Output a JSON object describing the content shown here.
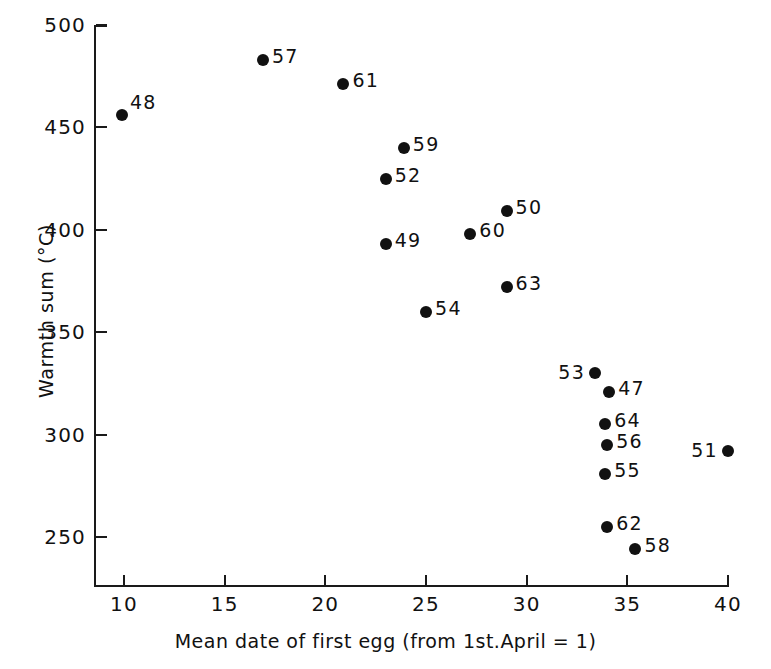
{
  "chart_data": {
    "type": "scatter",
    "title": "",
    "xlabel": "Mean date of first egg (from 1st.April = 1)",
    "ylabel": "Warmth sum (°C)",
    "xlim": [
      8.5,
      40.5
    ],
    "ylim": [
      236,
      500
    ],
    "xticks": [
      "10",
      "15",
      "20",
      "25",
      "30",
      "35",
      "40"
    ],
    "xtick_values": [
      10,
      15,
      20,
      25,
      30,
      35,
      40
    ],
    "yticks": [
      "250",
      "300",
      "350",
      "400",
      "450",
      "500"
    ],
    "ytick_values": [
      250,
      300,
      350,
      400,
      450,
      500
    ],
    "grid": false,
    "legend": "none",
    "point_labels": "year (last two digits)",
    "points": [
      {
        "label": "48",
        "x": 9.9,
        "y": 456,
        "label_pos": "up-right"
      },
      {
        "label": "57",
        "x": 16.9,
        "y": 483,
        "label_pos": "right"
      },
      {
        "label": "61",
        "x": 20.9,
        "y": 471,
        "label_pos": "right"
      },
      {
        "label": "59",
        "x": 23.9,
        "y": 440,
        "label_pos": "right"
      },
      {
        "label": "52",
        "x": 23.0,
        "y": 425,
        "label_pos": "right"
      },
      {
        "label": "49",
        "x": 23.0,
        "y": 393,
        "label_pos": "right"
      },
      {
        "label": "50",
        "x": 29.0,
        "y": 409,
        "label_pos": "right"
      },
      {
        "label": "60",
        "x": 27.2,
        "y": 398,
        "label_pos": "right"
      },
      {
        "label": "63",
        "x": 29.0,
        "y": 372,
        "label_pos": "right"
      },
      {
        "label": "54",
        "x": 25.0,
        "y": 360,
        "label_pos": "right"
      },
      {
        "label": "53",
        "x": 33.4,
        "y": 330,
        "label_pos": "left"
      },
      {
        "label": "47",
        "x": 34.1,
        "y": 321,
        "label_pos": "right"
      },
      {
        "label": "64",
        "x": 33.9,
        "y": 305,
        "label_pos": "right"
      },
      {
        "label": "56",
        "x": 34.0,
        "y": 295,
        "label_pos": "right"
      },
      {
        "label": "55",
        "x": 33.9,
        "y": 281,
        "label_pos": "right"
      },
      {
        "label": "51",
        "x": 40.0,
        "y": 292,
        "label_pos": "left"
      },
      {
        "label": "62",
        "x": 34.0,
        "y": 255,
        "label_pos": "right"
      },
      {
        "label": "58",
        "x": 35.4,
        "y": 244,
        "label_pos": "right"
      }
    ],
    "marker_color": "#111111",
    "axis_color": "#1a1a1a",
    "background_color": "#ffffff"
  }
}
